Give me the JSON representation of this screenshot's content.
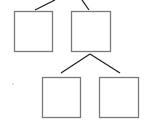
{
  "diagram": {
    "type": "tree",
    "colors": {
      "box_stroke": "#7a7a7a",
      "edge_stroke": "#222222",
      "background": "#ffffff",
      "dot": "#d8d8d8"
    },
    "nodes": [
      {
        "id": "node-a",
        "label": "",
        "x": 14,
        "y": 11,
        "w": 38,
        "h": 40
      },
      {
        "id": "node-b",
        "label": "",
        "x": 71,
        "y": 11,
        "w": 39,
        "h": 40
      },
      {
        "id": "node-c",
        "label": "",
        "x": 42,
        "y": 77,
        "w": 38,
        "h": 40
      },
      {
        "id": "node-d",
        "label": "",
        "x": 99,
        "y": 77,
        "w": 39,
        "h": 40
      }
    ],
    "edges": [
      {
        "from": "offscreen-parent",
        "to": "node-a",
        "x1": 55,
        "y1": 0,
        "x2": 35,
        "y2": 10
      },
      {
        "from": "offscreen-parent",
        "to": "node-b",
        "x1": 82,
        "y1": 0,
        "x2": 89,
        "y2": 10
      },
      {
        "from": "node-b",
        "to": "node-c",
        "x1": 90,
        "y1": 54,
        "x2": 61,
        "y2": 73
      },
      {
        "from": "node-b",
        "to": "node-d",
        "x1": 90,
        "y1": 54,
        "x2": 120,
        "y2": 73
      }
    ]
  }
}
